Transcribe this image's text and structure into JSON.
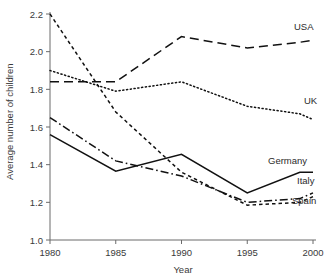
{
  "chart_data": {
    "type": "line",
    "title": "",
    "xlabel": "Year",
    "ylabel": "Average number of children",
    "x": [
      1980,
      1985,
      1990,
      1995,
      1999,
      2000
    ],
    "xlim": [
      1980,
      2000
    ],
    "ylim": [
      1.0,
      2.2
    ],
    "xticks": [
      "1980",
      "1985",
      "1990",
      "1995",
      "2000"
    ],
    "xtick_values": [
      1980,
      1985,
      1990,
      1995,
      2000
    ],
    "yticks": [
      "1.0",
      "1.2",
      "1.4",
      "1.6",
      "1.8",
      "2.0",
      "2.2"
    ],
    "ytick_values": [
      1.0,
      1.2,
      1.4,
      1.6,
      1.8,
      2.0,
      2.2
    ],
    "grid": false,
    "legend_position": "inline-right-labels",
    "series": [
      {
        "name": "USA",
        "label": "USA",
        "dash": "long-dash",
        "color": "#111111",
        "x": [
          1980,
          1985,
          1990,
          1995,
          1999,
          2000
        ],
        "values": [
          1.84,
          1.84,
          2.08,
          2.02,
          2.05,
          2.06
        ]
      },
      {
        "name": "UK",
        "label": "UK",
        "dash": "dotted",
        "color": "#111111",
        "x": [
          1980,
          1985,
          1990,
          1995,
          1999,
          2000
        ],
        "values": [
          1.9,
          1.79,
          1.84,
          1.71,
          1.67,
          1.64
        ]
      },
      {
        "name": "Spain",
        "label": "Spain",
        "dash": "short-dash",
        "color": "#111111",
        "x": [
          1980,
          1985,
          1990,
          1995,
          1999,
          2000
        ],
        "values": [
          2.2,
          1.68,
          1.36,
          1.185,
          1.2,
          1.23
        ]
      },
      {
        "name": "Italy",
        "label": "Italy",
        "dash": "dash-dot",
        "color": "#111111",
        "x": [
          1980,
          1985,
          1990,
          1995,
          1999,
          2000
        ],
        "values": [
          1.65,
          1.42,
          1.34,
          1.2,
          1.22,
          1.25
        ]
      },
      {
        "name": "Germany",
        "label": "Germany",
        "dash": "solid",
        "color": "#111111",
        "x": [
          1980,
          1985,
          1990,
          1995,
          1999,
          2000
        ],
        "values": [
          1.56,
          1.365,
          1.455,
          1.25,
          1.36,
          1.36
        ]
      }
    ],
    "series_labels": [
      {
        "name": "USA",
        "text": "USA",
        "x": 294,
        "y": 30
      },
      {
        "name": "UK",
        "text": "UK",
        "x": 304,
        "y": 104
      },
      {
        "name": "Germany",
        "text": "Germany",
        "x": 268,
        "y": 164
      },
      {
        "name": "Italy",
        "text": "Italy",
        "x": 297,
        "y": 184
      },
      {
        "name": "Spain",
        "text": "Spain",
        "x": 292,
        "y": 204
      }
    ]
  }
}
